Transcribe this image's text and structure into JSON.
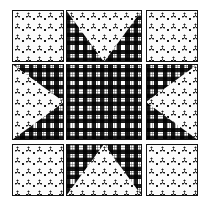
{
  "canvas": {
    "width": 202,
    "height": 199,
    "background": "#ffffff"
  },
  "palette": {
    "light_pattern_bg": "#fbfbfb",
    "light_pattern_motif": "#1a1a1a",
    "dark_pattern_bg": "#ffffff",
    "dark_pattern_ink": "#000000",
    "tile_border": "#111111"
  },
  "grid": {
    "name": "quilt-pattern-grid",
    "rows": 3,
    "columns": 3,
    "column_widths": [
      52,
      76,
      52
    ],
    "row_heights": [
      52,
      76,
      52
    ],
    "column_lefts": [
      12,
      66,
      146
    ],
    "row_tops": [
      10,
      64,
      144
    ],
    "gap": 2
  },
  "patterns": {
    "light": {
      "id": "light-floral",
      "label": "light floral dot motif",
      "description": "small three-dot cluster motifs in staggered rows on near-white ground"
    },
    "dark": {
      "id": "dark-gingham",
      "label": "dark gingham plaid",
      "description": "black and white gingham check with grey crossing texture"
    }
  },
  "tiles": [
    {
      "index": 0,
      "name": "tile-top-left",
      "row": 0,
      "column": 0,
      "base": "light",
      "overlay": "none",
      "overlay_shape": "clip-none",
      "description": "solid light floral"
    },
    {
      "index": 1,
      "name": "tile-top-center",
      "row": 0,
      "column": 1,
      "base": "dark",
      "overlay": "light",
      "overlay_shape": "clip-tri-down",
      "description": "light downward triangle on dark gingham"
    },
    {
      "index": 2,
      "name": "tile-top-right",
      "row": 0,
      "column": 2,
      "base": "light",
      "overlay": "none",
      "overlay_shape": "clip-none",
      "description": "solid light floral"
    },
    {
      "index": 3,
      "name": "tile-middle-left",
      "row": 1,
      "column": 0,
      "base": "dark",
      "overlay": "light",
      "overlay_shape": "clip-tri-right",
      "description": "light rightward triangle on dark gingham"
    },
    {
      "index": 4,
      "name": "tile-center",
      "row": 1,
      "column": 1,
      "base": "dark",
      "overlay": "none",
      "overlay_shape": "clip-none",
      "description": "solid dark gingham plaid"
    },
    {
      "index": 5,
      "name": "tile-middle-right",
      "row": 1,
      "column": 2,
      "base": "dark",
      "overlay": "light",
      "overlay_shape": "clip-tri-left",
      "description": "light leftward triangle on dark gingham"
    },
    {
      "index": 6,
      "name": "tile-bottom-left",
      "row": 2,
      "column": 0,
      "base": "light",
      "overlay": "none",
      "overlay_shape": "clip-none",
      "description": "solid light floral"
    },
    {
      "index": 7,
      "name": "tile-bottom-center",
      "row": 2,
      "column": 1,
      "base": "dark",
      "overlay": "light",
      "overlay_shape": "clip-tri-up",
      "description": "light upward triangle on dark gingham"
    },
    {
      "index": 8,
      "name": "tile-bottom-right",
      "row": 2,
      "column": 2,
      "base": "light",
      "overlay": "none",
      "overlay_shape": "clip-none",
      "description": "solid light floral"
    }
  ]
}
